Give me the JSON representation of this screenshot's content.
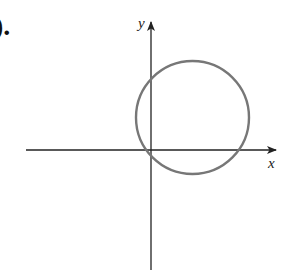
{
  "part_label": ").",
  "axes": {
    "x_label": "x",
    "y_label": "y",
    "axis_color": "#222222"
  },
  "circle": {
    "description": "circle in first quadrant passing near origin",
    "stroke_color": "#777777"
  }
}
